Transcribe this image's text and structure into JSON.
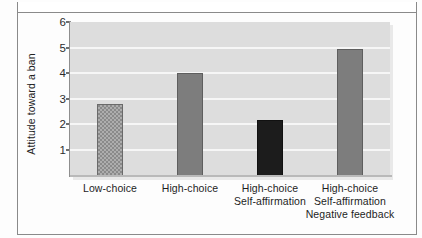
{
  "chart_data": {
    "type": "bar",
    "title": "",
    "xlabel": "",
    "ylabel": "Attitude toward a ban",
    "ylim": [
      0,
      6
    ],
    "yticks": [
      1,
      2,
      3,
      4,
      5,
      6
    ],
    "grid": true,
    "legend": "none",
    "categories": [
      "Low-choice",
      "High-choice",
      "High-choice Self-affirmation",
      "High-choice Self-affirmation Negative feedback"
    ],
    "category_lines": [
      [
        "Low-choice"
      ],
      [
        "High-choice"
      ],
      [
        "High-choice",
        "Self-affirmation"
      ],
      [
        "High-choice",
        "Self-affirmation",
        "Negative feedback"
      ]
    ],
    "values": [
      2.8,
      4.0,
      2.15,
      4.95
    ],
    "bar_styles": [
      "textured",
      "solid",
      "dark",
      "solid"
    ],
    "colors": {
      "bar_solid": "#7d7d7d",
      "bar_dark": "#1c1c1c",
      "bar_textured": "#8a8a8a",
      "plot_background": "#dddddd",
      "gridline": "#f6f6f6",
      "axis": "#8e8e8e",
      "text": "#1d1d1d"
    }
  }
}
